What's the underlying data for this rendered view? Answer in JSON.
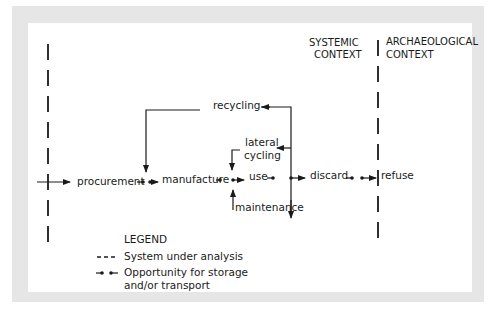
{
  "context_headers": {
    "systemic": [
      "SYSTEMIC",
      "CONTEXT"
    ],
    "archaeological": [
      "ARCHAEOLOGICAL",
      "CONTEXT"
    ]
  },
  "stages": {
    "procurement": "procurement",
    "manufacture": "manufacture",
    "use": "use",
    "discard": "discard",
    "refuse": "refuse"
  },
  "loops": {
    "recycling": "recycling",
    "lateral_cycling": [
      "lateral",
      "cycling"
    ],
    "maintenance": "maintenance"
  },
  "legend": {
    "title": "LEGEND",
    "items": [
      {
        "symbol": "dashed-line",
        "label": "System under analysis"
      },
      {
        "symbol": "storage-dots",
        "label": [
          "Opportunity for storage",
          "and/or transport"
        ]
      }
    ]
  },
  "colors": {
    "frame": "#e6e6e6",
    "panel": "#ffffff",
    "ink": "#1a1a1a"
  }
}
